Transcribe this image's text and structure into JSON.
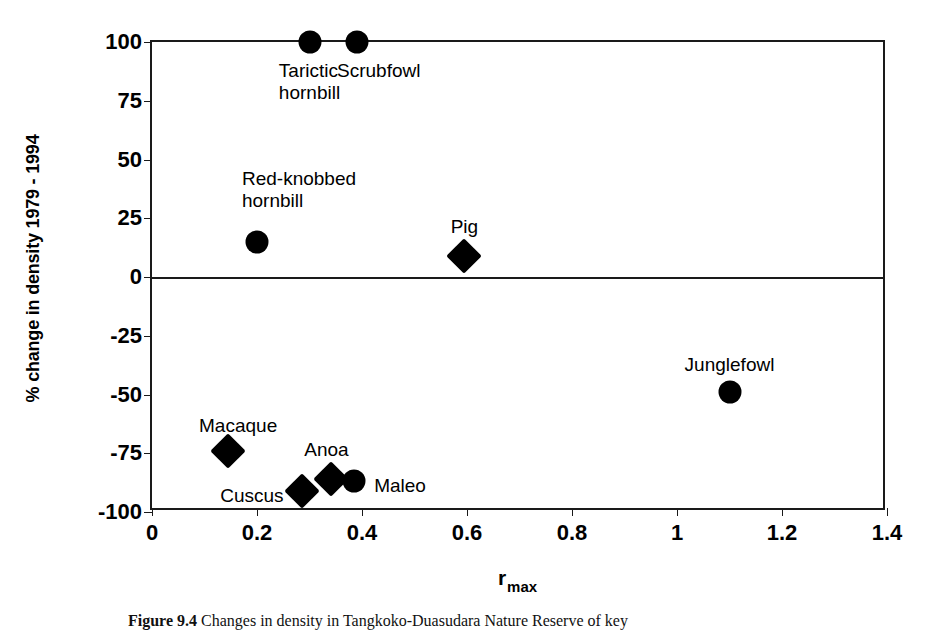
{
  "figure": {
    "caption_label": "Figure 9.4",
    "caption_text": "Changes in density in Tangkoko-Duasudara Nature Reserve of key"
  },
  "chart_data": {
    "type": "scatter",
    "title": "",
    "xlabel": "r",
    "xlabel_sub": "max",
    "ylabel": "% change in density 1979 - 1994",
    "xlim": [
      0,
      1.4
    ],
    "ylim": [
      -100,
      100
    ],
    "xticks": [
      "0",
      "0.2",
      "0.4",
      "0.6",
      "0.8",
      "1",
      "1.2",
      "1.4"
    ],
    "xtick_values": [
      0,
      0.2,
      0.4,
      0.6,
      0.8,
      1.0,
      1.2,
      1.4
    ],
    "yticks": [
      "100",
      "75",
      "50",
      "25",
      "0",
      "-25",
      "-50",
      "-75",
      "-100"
    ],
    "ytick_values": [
      100,
      75,
      50,
      25,
      0,
      -25,
      -50,
      -75,
      -100
    ],
    "grid": false,
    "legend": "none",
    "zero_line": true,
    "marker_color": "#000000",
    "points": [
      {
        "name": "Tarictic hornbill",
        "label": "Tarictic\nhornbill",
        "x": 0.3,
        "y": 100,
        "marker": "circle",
        "label_pos": "below-center",
        "label_dx": 0,
        "label_dy": 18
      },
      {
        "name": "Scrubfowl",
        "label": "Scrubfowl",
        "x": 0.39,
        "y": 100,
        "marker": "circle",
        "label_pos": "below-center",
        "label_dx": 22,
        "label_dy": 18
      },
      {
        "name": "Red-knobbed hornbill",
        "label": "Red-knobbed\nhornbill",
        "x": 0.2,
        "y": 15,
        "marker": "circle",
        "label_pos": "above-center",
        "label_dx": 42,
        "label_dy": -74
      },
      {
        "name": "Pig",
        "label": "Pig",
        "x": 0.595,
        "y": 9,
        "marker": "diamond",
        "label_pos": "above-center",
        "label_dx": 0,
        "label_dy": -40
      },
      {
        "name": "Junglefowl",
        "label": "Junglefowl",
        "x": 1.1,
        "y": -49,
        "marker": "circle",
        "label_pos": "above-center",
        "label_dx": 0,
        "label_dy": -38
      },
      {
        "name": "Macaque",
        "label": "Macaque",
        "x": 0.145,
        "y": -74,
        "marker": "diamond",
        "label_pos": "above-center",
        "label_dx": 10,
        "label_dy": -36
      },
      {
        "name": "Cuscus",
        "label": "Cuscus",
        "x": 0.285,
        "y": -91,
        "marker": "left",
        "label_pos": "left",
        "label_dx": -18,
        "label_dy": -6
      },
      {
        "name": "Anoa",
        "label": "Anoa",
        "x": 0.34,
        "y": -86,
        "marker": "diamond",
        "label_pos": "above-center",
        "label_dx": -4,
        "label_dy": -40
      },
      {
        "name": "Maleo",
        "label": "Maleo",
        "x": 0.385,
        "y": -87,
        "marker": "circle",
        "label_pos": "right",
        "label_dx": 20,
        "label_dy": -6
      }
    ]
  }
}
